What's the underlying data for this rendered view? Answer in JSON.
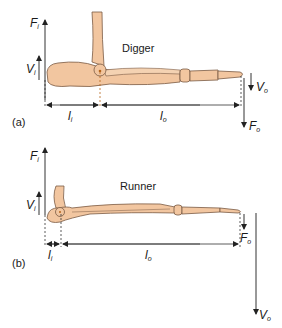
{
  "figure": {
    "panel_a": {
      "tag": "(a)",
      "title": "Digger",
      "labels": {
        "force_in": {
          "main": "F",
          "sub": "i"
        },
        "velocity_in": {
          "main": "V",
          "sub": "i"
        },
        "lever_in": {
          "main": "l",
          "sub": "i"
        },
        "lever_out": {
          "main": "l",
          "sub": "o"
        },
        "velocity_out": {
          "main": "V",
          "sub": "o"
        },
        "force_out": {
          "main": "F",
          "sub": "o"
        }
      }
    },
    "panel_b": {
      "tag": "(b)",
      "title": "Runner",
      "labels": {
        "force_in": {
          "main": "F",
          "sub": "i"
        },
        "velocity_in": {
          "main": "V",
          "sub": "i"
        },
        "lever_in": {
          "main": "l",
          "sub": "i"
        },
        "lever_out": {
          "main": "l",
          "sub": "o"
        },
        "force_out": {
          "main": "F",
          "sub": "o"
        },
        "velocity_out": {
          "main": "V",
          "sub": "o"
        }
      }
    },
    "colors": {
      "bone_fill": "#f2c6a0",
      "bone_stroke": "#7a5a44",
      "line": "#333333",
      "pivot": "#b5651d"
    }
  }
}
